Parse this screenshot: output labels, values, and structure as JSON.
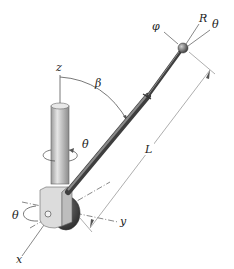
{
  "diagram": {
    "labels": {
      "phi": "φ",
      "R": "R",
      "theta_top": "θ",
      "z": "z",
      "beta": "β",
      "theta_dot": "θ̇",
      "L": "L",
      "theta_base": "θ",
      "y": "y",
      "x": "x"
    },
    "colors": {
      "rod": "#6b6b6b",
      "rod_dark": "#3e3e3e",
      "column": "#c8c8c8",
      "block": "#d9d9d9",
      "wheel": "#4a4a4a",
      "line": "#555555"
    }
  }
}
